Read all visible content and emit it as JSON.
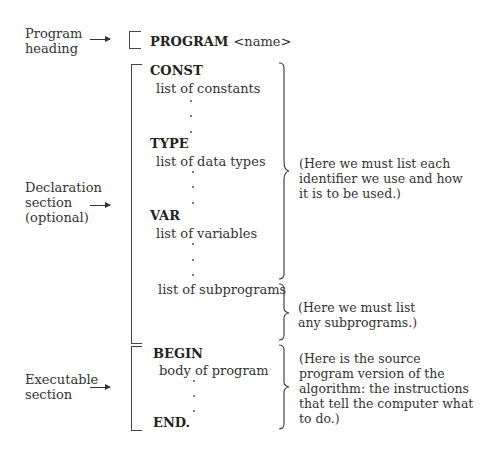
{
  "left_labels": {
    "program_heading": [
      "Program",
      "heading"
    ],
    "declaration_section": [
      "Declaration",
      "section",
      "(optional)"
    ],
    "executable_section": [
      "Executable",
      "section"
    ]
  },
  "program_line": {
    "keyword": "PROGRAM",
    "argument": "<name>"
  },
  "declarations": {
    "const": {
      "keyword": "CONST",
      "item": "list of constants"
    },
    "type": {
      "keyword": "TYPE",
      "item": "list of data types"
    },
    "var": {
      "keyword": "VAR",
      "item": "list of variables"
    },
    "subprograms": {
      "item": "list of subprograms"
    }
  },
  "executable": {
    "begin": "BEGIN",
    "body": "body of program",
    "end": "END."
  },
  "notes": {
    "identifiers": [
      "(Here we must list each",
      "identifier we use and how",
      "it is to be used.)"
    ],
    "subprograms": [
      "(Here we must list",
      "any subprograms.)"
    ],
    "source": [
      "(Here is the source",
      "program version of the",
      "algorithm: the instructions",
      "that tell the computer what",
      "to do.)"
    ]
  },
  "ellipsis_glyph": "·",
  "colors": {
    "ink": "#333333",
    "background": "#ffffff"
  }
}
